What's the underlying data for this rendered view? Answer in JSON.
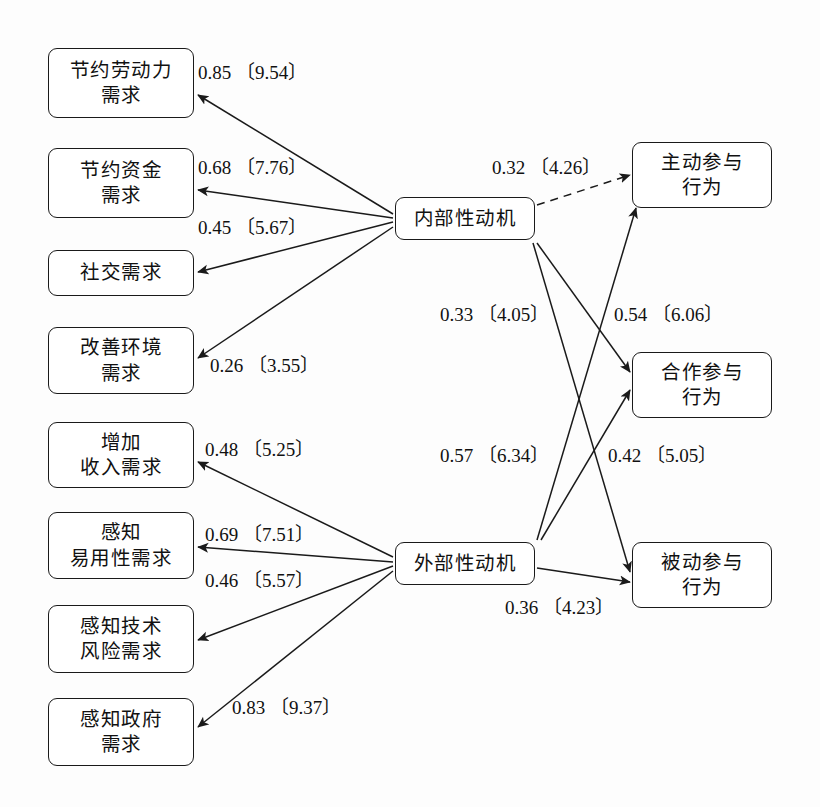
{
  "diagram": {
    "type": "path-diagram",
    "line_color": "#1a1a1a",
    "box_fill": "#ffffff"
  },
  "nodes": {
    "left": [
      {
        "id": "n1",
        "label": "节约劳动力\n需求",
        "x": 48,
        "y": 48,
        "w": 146,
        "h": 70
      },
      {
        "id": "n2",
        "label": "节约资金\n需求",
        "x": 48,
        "y": 148,
        "w": 146,
        "h": 70
      },
      {
        "id": "n3",
        "label": "社交需求",
        "x": 48,
        "y": 250,
        "w": 146,
        "h": 46
      },
      {
        "id": "n4",
        "label": "改善环境\n需求",
        "x": 48,
        "y": 327,
        "w": 146,
        "h": 67
      },
      {
        "id": "n5",
        "label": "增加\n收入需求",
        "x": 48,
        "y": 422,
        "w": 146,
        "h": 66
      },
      {
        "id": "n6",
        "label": "感知\n易用性需求",
        "x": 48,
        "y": 512,
        "w": 146,
        "h": 67
      },
      {
        "id": "n7",
        "label": "感知技术\n风险需求",
        "x": 48,
        "y": 605,
        "w": 146,
        "h": 68
      },
      {
        "id": "n8",
        "label": "感知政府\n需求",
        "x": 48,
        "y": 698,
        "w": 146,
        "h": 68
      }
    ],
    "middle": [
      {
        "id": "m1",
        "label": "内部性动机",
        "x": 395,
        "y": 197,
        "w": 140,
        "h": 43
      },
      {
        "id": "m2",
        "label": "外部性动机",
        "x": 395,
        "y": 542,
        "w": 140,
        "h": 43
      }
    ],
    "right": [
      {
        "id": "r1",
        "label": "主动参与\n行为",
        "x": 632,
        "y": 142,
        "w": 140,
        "h": 66
      },
      {
        "id": "r2",
        "label": "合作参与\n行为",
        "x": 632,
        "y": 352,
        "w": 140,
        "h": 66
      },
      {
        "id": "r3",
        "label": "被动参与\n行为",
        "x": 632,
        "y": 542,
        "w": 140,
        "h": 66
      }
    ]
  },
  "edges": [
    {
      "id": "e1",
      "from": "m1",
      "to": "n1",
      "coef": "0.85",
      "t": "9.54",
      "style": "solid",
      "x1": 393,
      "y1": 214,
      "x2": 198,
      "y2": 95,
      "label_x": 198,
      "label_y": 57
    },
    {
      "id": "e2",
      "from": "m1",
      "to": "n2",
      "coef": "0.68",
      "t": "7.76",
      "style": "solid",
      "x1": 393,
      "y1": 218,
      "x2": 198,
      "y2": 190,
      "label_x": 198,
      "label_y": 152
    },
    {
      "id": "e3",
      "from": "m1",
      "to": "n3",
      "coef": "0.45",
      "t": "5.67",
      "style": "solid",
      "x1": 393,
      "y1": 222,
      "x2": 198,
      "y2": 272,
      "label_x": 198,
      "label_y": 212
    },
    {
      "id": "e4",
      "from": "m1",
      "to": "n4",
      "coef": "0.26",
      "t": "3.55",
      "style": "solid",
      "x1": 393,
      "y1": 227,
      "x2": 198,
      "y2": 358,
      "label_x": 210,
      "label_y": 350
    },
    {
      "id": "e5",
      "from": "m2",
      "to": "n5",
      "coef": "0.48",
      "t": "5.25",
      "style": "solid",
      "x1": 393,
      "y1": 557,
      "x2": 198,
      "y2": 462,
      "label_x": 205,
      "label_y": 434
    },
    {
      "id": "e6",
      "from": "m2",
      "to": "n6",
      "coef": "0.69",
      "t": "7.51",
      "style": "solid",
      "x1": 393,
      "y1": 562,
      "x2": 198,
      "y2": 547,
      "label_x": 205,
      "label_y": 519
    },
    {
      "id": "e7",
      "from": "m2",
      "to": "n7",
      "coef": "0.46",
      "t": "5.57",
      "style": "solid",
      "x1": 393,
      "y1": 566,
      "x2": 198,
      "y2": 640,
      "label_x": 205,
      "label_y": 565
    },
    {
      "id": "e8",
      "from": "m2",
      "to": "n8",
      "coef": "0.83",
      "t": "9.37",
      "style": "solid",
      "x1": 393,
      "y1": 571,
      "x2": 198,
      "y2": 727,
      "label_x": 232,
      "label_y": 692
    },
    {
      "id": "e9",
      "from": "m1",
      "to": "r1",
      "coef": "0.32",
      "t": "4.26",
      "style": "dashed",
      "x1": 537,
      "y1": 205,
      "x2": 630,
      "y2": 175,
      "label_x": 492,
      "label_y": 152
    },
    {
      "id": "e10",
      "from": "m1",
      "to": "r2",
      "coef": "0.54",
      "t": "6.06",
      "style": "solid",
      "x1": 537,
      "y1": 243,
      "x2": 630,
      "y2": 372,
      "label_x": 614,
      "label_y": 299
    },
    {
      "id": "e11",
      "from": "m1",
      "to": "r3",
      "coef": "0.57",
      "t": "6.34",
      "style": "solid",
      "x1": 533,
      "y1": 243,
      "x2": 630,
      "y2": 572,
      "label_x": 440,
      "label_y": 440
    },
    {
      "id": "e12",
      "from": "m2",
      "to": "r1",
      "coef": "0.33",
      "t": "4.05",
      "style": "solid",
      "x1": 537,
      "y1": 540,
      "x2": 636,
      "y2": 208,
      "label_x": 440,
      "label_y": 299
    },
    {
      "id": "e13",
      "from": "m2",
      "to": "r2",
      "coef": "0.42",
      "t": "5.05",
      "style": "solid",
      "x1": 541,
      "y1": 540,
      "x2": 630,
      "y2": 390,
      "label_x": 608,
      "label_y": 440
    },
    {
      "id": "e14",
      "from": "m2",
      "to": "r3",
      "coef": "0.36",
      "t": "4.23",
      "style": "solid",
      "x1": 537,
      "y1": 568,
      "x2": 630,
      "y2": 582,
      "label_x": 505,
      "label_y": 592
    }
  ],
  "chart_data": {
    "type": "diagram",
    "paths": [
      {
        "source": "内部性动机",
        "target": "节约劳动力需求",
        "estimate": 0.85,
        "t_value": 9.54,
        "significant": true
      },
      {
        "source": "内部性动机",
        "target": "节约资金需求",
        "estimate": 0.68,
        "t_value": 7.76,
        "significant": true
      },
      {
        "source": "内部性动机",
        "target": "社交需求",
        "estimate": 0.45,
        "t_value": 5.67,
        "significant": true
      },
      {
        "source": "内部性动机",
        "target": "改善环境需求",
        "estimate": 0.26,
        "t_value": 3.55,
        "significant": true
      },
      {
        "source": "外部性动机",
        "target": "增加收入需求",
        "estimate": 0.48,
        "t_value": 5.25,
        "significant": true
      },
      {
        "source": "外部性动机",
        "target": "感知易用性需求",
        "estimate": 0.69,
        "t_value": 7.51,
        "significant": true
      },
      {
        "source": "外部性动机",
        "target": "感知技术风险需求",
        "estimate": 0.46,
        "t_value": 5.57,
        "significant": true
      },
      {
        "source": "外部性动机",
        "target": "感知政府需求",
        "estimate": 0.83,
        "t_value": 9.37,
        "significant": true
      },
      {
        "source": "内部性动机",
        "target": "主动参与行为",
        "estimate": 0.32,
        "t_value": 4.26,
        "line": "dashed"
      },
      {
        "source": "内部性动机",
        "target": "合作参与行为",
        "estimate": 0.54,
        "t_value": 6.06,
        "line": "solid"
      },
      {
        "source": "内部性动机",
        "target": "被动参与行为",
        "estimate": 0.57,
        "t_value": 6.34,
        "line": "solid"
      },
      {
        "source": "外部性动机",
        "target": "主动参与行为",
        "estimate": 0.33,
        "t_value": 4.05,
        "line": "solid"
      },
      {
        "source": "外部性动机",
        "target": "合作参与行为",
        "estimate": 0.42,
        "t_value": 5.05,
        "line": "solid"
      },
      {
        "source": "外部性动机",
        "target": "被动参与行为",
        "estimate": 0.36,
        "t_value": 4.23,
        "line": "solid"
      }
    ],
    "notation": "系数〔t 值〕"
  }
}
